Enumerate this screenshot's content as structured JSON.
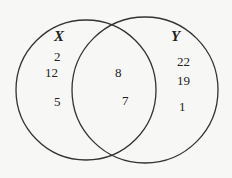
{
  "diagram": {
    "type": "venn",
    "sets": [
      {
        "name": "X",
        "label_pos": [
          54,
          32
        ],
        "only": [
          {
            "value": "2",
            "pos": [
              54,
              50
            ]
          },
          {
            "value": "12",
            "pos": [
              44,
              64
            ]
          },
          {
            "value": "5",
            "pos": [
              53,
              94
            ]
          }
        ]
      },
      {
        "name": "Y",
        "label_pos": [
          172,
          32
        ],
        "only": [
          {
            "value": "22",
            "pos": [
              177,
              56
            ]
          },
          {
            "value": "19",
            "pos": [
              178,
              75
            ]
          },
          {
            "value": "1",
            "pos": [
              180,
              101
            ]
          }
        ]
      }
    ],
    "intersection": [
      {
        "value": "8",
        "pos": [
          115,
          66
        ]
      },
      {
        "value": "7",
        "pos": [
          122,
          94
        ]
      }
    ],
    "stroke_color": "#333333"
  }
}
